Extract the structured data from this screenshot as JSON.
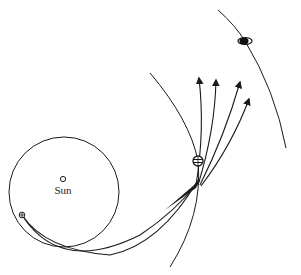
{
  "diagram": {
    "type": "orbital trajectory diagram",
    "labels": {
      "sun": "Sun"
    },
    "bodies": [
      {
        "name": "sun",
        "marker": "small open circle",
        "x": 63,
        "y": 179
      },
      {
        "name": "earth",
        "marker": "small circle with cross",
        "x": 22,
        "y": 215
      },
      {
        "name": "jupiter",
        "marker": "banded circle",
        "x": 198,
        "y": 161
      },
      {
        "name": "saturn",
        "marker": "ringed dark ellipse",
        "x": 245,
        "y": 41
      }
    ],
    "orbits": [
      {
        "name": "earth-orbit",
        "shape": "circle",
        "cx": 64,
        "cy": 192,
        "r": 55
      },
      {
        "name": "jupiter-orbit",
        "shape": "arc"
      },
      {
        "name": "saturn-orbit",
        "shape": "arc"
      }
    ],
    "trajectories": {
      "transfer_paths": 2,
      "outgoing_arrows": 4
    },
    "colors": {
      "stroke": "#1a1a1a",
      "background": "#ffffff"
    }
  }
}
